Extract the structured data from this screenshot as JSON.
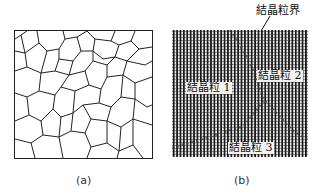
{
  "panel_a": {
    "caption": "(a)",
    "description": "polycrystalline grain structure (grain boundary network)"
  },
  "panel_b": {
    "caption": "(b)",
    "boundary_label": "結晶粒界",
    "grains": [
      {
        "label": "結晶粒 1"
      },
      {
        "label": "結晶粒 2"
      },
      {
        "label": "結晶粒 3"
      }
    ]
  }
}
